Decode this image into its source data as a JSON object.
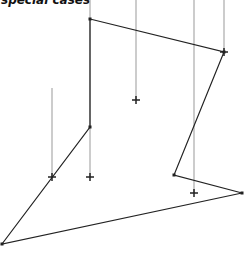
{
  "title": "special cases",
  "colors": {
    "polygon": "#222222",
    "ray": "#999999",
    "marker": "#222222"
  },
  "polygon": [
    [
      90,
      19
    ],
    [
      224,
      52
    ],
    [
      174,
      175
    ],
    [
      242,
      193
    ],
    [
      2,
      244
    ],
    [
      90,
      127
    ]
  ],
  "rays": [
    {
      "x": 52,
      "y1": 88,
      "y2": 177
    },
    {
      "x": 90,
      "y1": 0,
      "y2": 177
    },
    {
      "x": 136,
      "y1": 0,
      "y2": 100
    },
    {
      "x": 194,
      "y1": 0,
      "y2": 193
    },
    {
      "x": 224,
      "y1": 0,
      "y2": 52
    }
  ],
  "markers": [
    {
      "x": 52,
      "y": 177
    },
    {
      "x": 90,
      "y": 177
    },
    {
      "x": 136,
      "y": 100
    },
    {
      "x": 194,
      "y": 193
    },
    {
      "x": 224,
      "y": 52
    }
  ]
}
